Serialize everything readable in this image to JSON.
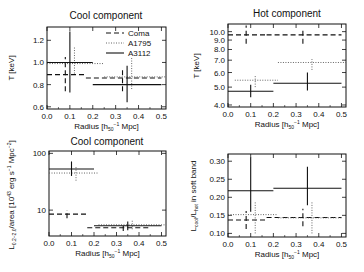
{
  "chart_data": [
    {
      "type": "scatter",
      "title": "Cool component",
      "xlabel": "Radius [h50^-1 Mpc]",
      "ylabel": "T [keV]",
      "xlim": [
        0,
        0.52
      ],
      "ylim": [
        0.58,
        1.32
      ],
      "yscale": "linear",
      "xticks": [
        "0.0",
        "0.1",
        "0.2",
        "0.3",
        "0.4",
        "0.5"
      ],
      "yticks": [
        "0.6",
        "0.8",
        "1.0",
        "1.2"
      ],
      "legend": [
        "Coma",
        "A1795",
        "A3112"
      ],
      "series": [
        {
          "name": "Coma",
          "style": "dashed",
          "points": [
            {
              "x": 0.08,
              "xlo": 0.0,
              "xhi": 0.17,
              "y": 0.89,
              "ylo": 0.74,
              "yhi": 1.05
            },
            {
              "x": 0.33,
              "xlo": 0.17,
              "xhi": 0.5,
              "y": 0.86,
              "ylo": 0.74,
              "yhi": 0.95
            }
          ]
        },
        {
          "name": "A1795",
          "style": "dotted",
          "points": [
            {
              "x": 0.12,
              "xlo": 0.0,
              "xhi": 0.25,
              "y": 0.99,
              "ylo": 0.9,
              "yhi": 1.14
            },
            {
              "x": 0.37,
              "xlo": 0.25,
              "xhi": 0.52,
              "y": 0.87,
              "ylo": 0.76,
              "yhi": 1.04
            }
          ]
        },
        {
          "name": "A3112",
          "style": "solid",
          "points": [
            {
              "x": 0.1,
              "xlo": 0.0,
              "xhi": 0.2,
              "y": 1.0,
              "ylo": 0.73,
              "yhi": 1.28
            },
            {
              "x": 0.35,
              "xlo": 0.2,
              "xhi": 0.5,
              "y": 0.8,
              "ylo": 0.64,
              "yhi": 0.97
            }
          ]
        }
      ]
    },
    {
      "type": "scatter",
      "title": "Hot component",
      "xlabel": "Radius [h50^-1 Mpc]",
      "ylabel": "T [keV]",
      "xlim": [
        0,
        0.52
      ],
      "ylim": [
        3.9,
        11.0
      ],
      "yscale": "log",
      "xticks": [
        "0.0",
        "0.1",
        "0.2",
        "0.3",
        "0.4",
        "0.5"
      ],
      "yticks": [
        "4.0",
        "5.0",
        "6.0",
        "7.0",
        "8.0",
        "9.0",
        "10.0"
      ],
      "series": [
        {
          "name": "Coma",
          "style": "dashed",
          "points": [
            {
              "x": 0.08,
              "xlo": 0.0,
              "xhi": 0.17,
              "y": 9.6,
              "ylo": 8.6,
              "yhi": 10.8
            },
            {
              "x": 0.33,
              "xlo": 0.17,
              "xhi": 0.5,
              "y": 9.6,
              "ylo": 8.6,
              "yhi": 10.5
            }
          ]
        },
        {
          "name": "A1795",
          "style": "dotted",
          "points": [
            {
              "x": 0.12,
              "xlo": 0.03,
              "xhi": 0.22,
              "y": 5.45,
              "ylo": 5.0,
              "yhi": 5.8
            },
            {
              "x": 0.37,
              "xlo": 0.22,
              "xhi": 0.52,
              "y": 6.8,
              "ylo": 6.2,
              "yhi": 7.1
            }
          ]
        },
        {
          "name": "A3112",
          "style": "solid",
          "points": [
            {
              "x": 0.1,
              "xlo": 0.0,
              "xhi": 0.2,
              "y": 4.75,
              "ylo": 4.4,
              "yhi": 5.15
            },
            {
              "x": 0.35,
              "xlo": 0.2,
              "xhi": 0.5,
              "y": 5.25,
              "ylo": 4.8,
              "yhi": 6.0
            }
          ]
        }
      ]
    },
    {
      "type": "scatter",
      "title": "Cool component",
      "xlabel": "Radius [h50^-1 Mpc]",
      "ylabel": "L0.2-2.0/area [10^45 erg s^-1 Mpc^-2]",
      "xlim": [
        0,
        0.52
      ],
      "ylim": [
        3.5,
        110
      ],
      "yscale": "log",
      "xticks": [
        "0.0",
        "0.1",
        "0.2",
        "0.3",
        "0.4",
        "0.5"
      ],
      "yticks": [
        "10",
        "100"
      ],
      "series": [
        {
          "name": "Coma",
          "style": "dashed",
          "points": [
            {
              "x": 0.08,
              "xlo": 0.0,
              "xhi": 0.17,
              "y": 8.5,
              "ylo": 7.2,
              "yhi": 10.0
            },
            {
              "x": 0.33,
              "xlo": 0.17,
              "xhi": 0.45,
              "y": 4.9,
              "ylo": 4.3,
              "yhi": 5.5
            }
          ]
        },
        {
          "name": "A1795",
          "style": "dotted",
          "points": [
            {
              "x": 0.12,
              "xlo": 0.0,
              "xhi": 0.22,
              "y": 45,
              "ylo": 33,
              "yhi": 60
            },
            {
              "x": 0.37,
              "xlo": 0.22,
              "xhi": 0.52,
              "y": 5.5,
              "ylo": 4.6,
              "yhi": 6.8
            }
          ]
        },
        {
          "name": "A3112",
          "style": "solid",
          "points": [
            {
              "x": 0.1,
              "xlo": 0.0,
              "xhi": 0.2,
              "y": 53,
              "ylo": 40,
              "yhi": 72
            },
            {
              "x": 0.35,
              "xlo": 0.2,
              "xhi": 0.5,
              "y": 5.3,
              "ylo": 4.4,
              "yhi": 6.3
            }
          ]
        }
      ]
    },
    {
      "type": "scatter",
      "title": "",
      "xlabel": "Radius [h50^-1 Mpc]",
      "ylabel": "Lcool/Lhot in soft band",
      "xlim": [
        0,
        0.52
      ],
      "ylim": [
        0.09,
        0.32
      ],
      "yscale": "linear",
      "xticks": [
        "0.0",
        "0.1",
        "0.2",
        "0.3",
        "0.4",
        "0.5"
      ],
      "yticks": [
        "0.10",
        "0.15",
        "0.20",
        "0.25",
        "0.30"
      ],
      "series": [
        {
          "name": "Coma",
          "style": "dashed",
          "points": [
            {
              "x": 0.08,
              "xlo": 0.0,
              "xhi": 0.17,
              "y": 0.137,
              "ylo": 0.112,
              "yhi": 0.162
            },
            {
              "x": 0.33,
              "xlo": 0.17,
              "xhi": 0.5,
              "y": 0.144,
              "ylo": 0.12,
              "yhi": 0.168
            }
          ]
        },
        {
          "name": "A1795",
          "style": "dotted",
          "points": [
            {
              "x": 0.12,
              "xlo": 0.0,
              "xhi": 0.22,
              "y": 0.152,
              "ylo": 0.1,
              "yhi": 0.188
            },
            {
              "x": 0.37,
              "xlo": 0.22,
              "xhi": 0.5,
              "y": 0.143,
              "ylo": 0.1,
              "yhi": 0.188
            }
          ]
        },
        {
          "name": "A3112",
          "style": "solid",
          "points": [
            {
              "x": 0.1,
              "xlo": 0.0,
              "xhi": 0.2,
              "y": 0.218,
              "ylo": 0.16,
              "yhi": 0.31
            },
            {
              "x": 0.35,
              "xlo": 0.2,
              "xhi": 0.5,
              "y": 0.225,
              "ylo": 0.178,
              "yhi": 0.285
            }
          ]
        }
      ]
    }
  ],
  "panels_layout": [
    {
      "x0": 47,
      "y0": 27,
      "x1": 166,
      "y1": 109
    },
    {
      "x0": 228,
      "y0": 24,
      "x1": 346,
      "y1": 107
    },
    {
      "x0": 49,
      "y0": 151,
      "x1": 166,
      "y1": 236
    },
    {
      "x0": 228,
      "y0": 154,
      "x1": 346,
      "y1": 237
    }
  ],
  "labels": {
    "panel1_title": "Cool component",
    "panel2_title": "Hot component",
    "panel3_title": "Cool component",
    "xlabel_main": "Radius [h",
    "xlabel_sub": "50",
    "xlabel_sup": "−1",
    "xlabel_end": " Mpc]",
    "ylabel_T": "T [keV]",
    "ylabel_L": "L",
    "ylabel_L_sub": "0.2−2.0",
    "ylabel_L_rest": "/area [10",
    "ylabel_L_sup": "43",
    "ylabel_L_rest2": " erg s",
    "ylabel_L_sup2": "−1",
    "ylabel_L_rest3": " Mpc",
    "ylabel_L_sup3": "−2",
    "ylabel_L_end": "]",
    "ylabel_ratio_a": "L",
    "ylabel_ratio_sub1": "cool",
    "ylabel_ratio_b": "/L",
    "ylabel_ratio_sub2": "hot",
    "ylabel_ratio_c": " in soft band"
  },
  "colors": {
    "ink": "#111111",
    "dotted": "#555555",
    "background": "#ffffff"
  }
}
